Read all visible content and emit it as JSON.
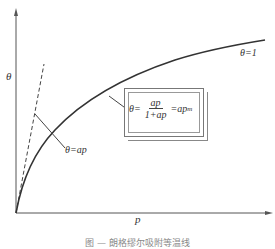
{
  "diagram": {
    "axes": {
      "y_label": "θ",
      "x_label": "p"
    },
    "curves": {
      "main": "Langmuir isotherm curve",
      "dashed": "linear low-pressure limit"
    },
    "annotations": {
      "saturation": "θ=1",
      "linear": "θ=ap",
      "formula_lhs": "θ=",
      "formula_num": "ap",
      "formula_den": "1+ap",
      "formula_rhs": "=ap",
      "formula_rhs_exp": "m"
    },
    "caption": "图 — 朗格缪尔吸附等温线"
  }
}
